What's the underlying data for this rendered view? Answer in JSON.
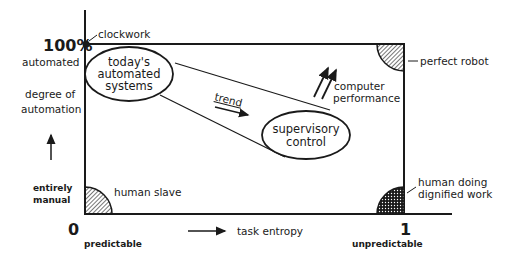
{
  "diagram": {
    "y_axis": {
      "top_value": "100%",
      "top_label": "automated",
      "title_line1": "degree of",
      "title_line2": "automation",
      "bottom_label_line1": "entirely",
      "bottom_label_line2": "manual",
      "origin": "0"
    },
    "x_axis": {
      "left_label": "predictable",
      "title": "task entropy",
      "right_value": "1",
      "right_label": "unpredictable"
    },
    "corners": {
      "top_left": "clockwork",
      "top_right": "perfect robot",
      "bottom_left": "human slave",
      "bottom_right_line1": "human doing",
      "bottom_right_line2": "dignified work"
    },
    "regions": {
      "automated_systems_line1": "today's",
      "automated_systems_line2": "automated",
      "automated_systems_line3": "systems",
      "supervisory_line1": "supervisory",
      "supervisory_line2": "control",
      "trend": "trend",
      "computer_line1": "computer",
      "computer_line2": "performance"
    },
    "colors": {
      "ink": "#1a1a1a",
      "background": "#ffffff"
    }
  }
}
